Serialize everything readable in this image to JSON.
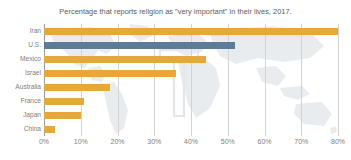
{
  "chart_data": {
    "type": "bar",
    "orientation": "horizontal",
    "title": "Percentage that reports religion as \"very important\" in their lives, 2017.",
    "xlabel": "",
    "ylabel": "",
    "categories": [
      "Iran",
      "U.S.",
      "Mexico",
      "Israel",
      "Australia",
      "France",
      "Japan",
      "China"
    ],
    "values": [
      80,
      52,
      44,
      36,
      18,
      11,
      10,
      3
    ],
    "xlim": [
      0,
      80
    ],
    "xticks": [
      0,
      10,
      20,
      30,
      40,
      50,
      60,
      70,
      80
    ],
    "xtick_labels": [
      "0%",
      "10%",
      "20%",
      "30%",
      "40%",
      "50%",
      "60%",
      "70%",
      "80%"
    ],
    "grid": true,
    "legend": false,
    "bar_colors": [
      "#e5a83a",
      "#5c7b96",
      "#e5a83a",
      "#e5a83a",
      "#e5a83a",
      "#e5a83a",
      "#e5a83a",
      "#e5a83a"
    ],
    "highlight_category": "U.S.",
    "series": [
      {
        "name": "Religion very important",
        "values": [
          80,
          52,
          44,
          36,
          18,
          11,
          10,
          3
        ]
      }
    ],
    "annotations": []
  },
  "style": {
    "accent_orange": "#e5a83a",
    "accent_blue": "#5c7b96",
    "gridline_color": "#d3d3d3",
    "axis_color": "#9a9a9a",
    "label_color": "#808080",
    "title_color": "#5a5a5a",
    "background": "#ffffff",
    "watermark_color": "#e9ecef"
  },
  "watermark": {
    "name": "world-map-watermark",
    "logo_name": "t-logo-watermark"
  }
}
